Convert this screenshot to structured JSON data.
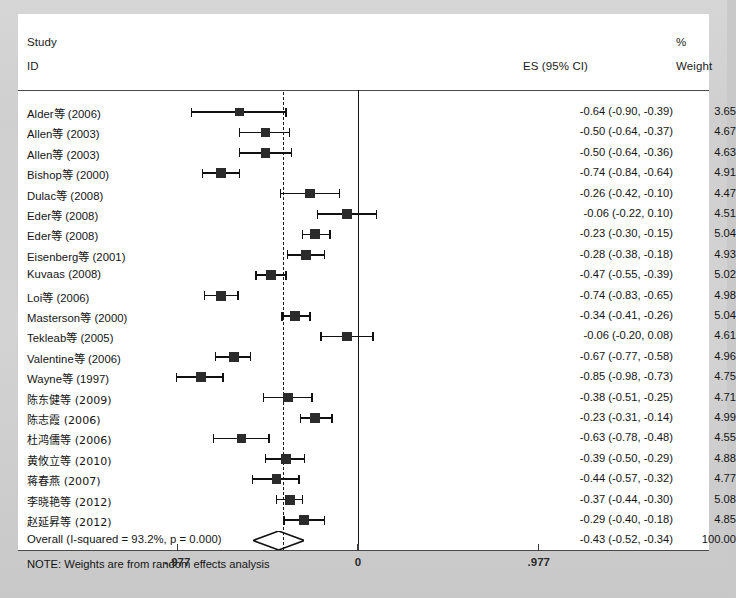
{
  "header": {
    "study_line1": "Study",
    "study_line2": "ID",
    "es_header": "ES (95% CI)",
    "weight_pct": "%",
    "weight_header": "Weight"
  },
  "note": "NOTE: Weights are from random effects analysis",
  "overall": {
    "label": "Overall  (I-squared = 93.2%, p = 0.000)",
    "es_text": "-0.43 (-0.52, -0.34)",
    "weight_text": "100.00"
  },
  "axis": {
    "left_label": "-.977",
    "center_label": "0",
    "right_label": ".977"
  },
  "chart_data": {
    "type": "forest",
    "title": "",
    "xlabel": "",
    "ylabel": "",
    "xlim": [
      -1.05,
      1.05
    ],
    "xticks": [
      -0.977,
      0,
      0.977
    ],
    "xticklabels": [
      "-.977",
      "0",
      ".977"
    ],
    "effect_measure": "ES (95% CI)",
    "null_line": 0,
    "pooled_line": -0.43,
    "heterogeneity": {
      "i_squared_pct": 93.2,
      "p_value": "0.000"
    },
    "pooled": {
      "es": -0.43,
      "lower": -0.52,
      "upper": -0.34,
      "weight": 100.0
    },
    "studies": [
      {
        "label": "Alder等 (2006)",
        "es": -0.64,
        "lower": -0.9,
        "upper": -0.39,
        "weight": 3.65,
        "es_text": "-0.64 (-0.90, -0.39)",
        "weight_text": "3.65"
      },
      {
        "label": "Allen等 (2003)",
        "es": -0.5,
        "lower": -0.64,
        "upper": -0.37,
        "weight": 4.67,
        "es_text": "-0.50 (-0.64, -0.37)",
        "weight_text": "4.67"
      },
      {
        "label": "Allen等 (2003)",
        "es": -0.5,
        "lower": -0.64,
        "upper": -0.36,
        "weight": 4.63,
        "es_text": "-0.50 (-0.64, -0.36)",
        "weight_text": "4.63"
      },
      {
        "label": "Bishop等 (2000)",
        "es": -0.74,
        "lower": -0.84,
        "upper": -0.64,
        "weight": 4.91,
        "es_text": "-0.74 (-0.84, -0.64)",
        "weight_text": "4.91"
      },
      {
        "label": "Dulac等 (2008)",
        "es": -0.26,
        "lower": -0.42,
        "upper": -0.1,
        "weight": 4.47,
        "es_text": "-0.26 (-0.42, -0.10)",
        "weight_text": "4.47"
      },
      {
        "label": "Eder等 (2008)",
        "es": -0.06,
        "lower": -0.22,
        "upper": 0.1,
        "weight": 4.51,
        "es_text": "-0.06 (-0.22, 0.10)",
        "weight_text": "4.51"
      },
      {
        "label": "Eder等 (2008)",
        "es": -0.23,
        "lower": -0.3,
        "upper": -0.15,
        "weight": 5.04,
        "es_text": "-0.23 (-0.30, -0.15)",
        "weight_text": "5.04"
      },
      {
        "label": "Eisenberg等 (2001)",
        "es": -0.28,
        "lower": -0.38,
        "upper": -0.18,
        "weight": 4.93,
        "es_text": "-0.28 (-0.38, -0.18)",
        "weight_text": "4.93"
      },
      {
        "label": "Kuvaas (2008)",
        "es": -0.47,
        "lower": -0.55,
        "upper": -0.39,
        "weight": 5.02,
        "es_text": "-0.47 (-0.55, -0.39)",
        "weight_text": "5.02"
      },
      {
        "label": "Loi等 (2006)",
        "es": -0.74,
        "lower": -0.83,
        "upper": -0.65,
        "weight": 4.98,
        "es_text": "-0.74 (-0.83, -0.65)",
        "weight_text": "4.98"
      },
      {
        "label": "Masterson等 (2000)",
        "es": -0.34,
        "lower": -0.41,
        "upper": -0.26,
        "weight": 5.04,
        "es_text": "-0.34 (-0.41, -0.26)",
        "weight_text": "5.04"
      },
      {
        "label": "Tekleab等 (2005)",
        "es": -0.06,
        "lower": -0.2,
        "upper": 0.08,
        "weight": 4.61,
        "es_text": "-0.06 (-0.20, 0.08)",
        "weight_text": "4.61"
      },
      {
        "label": "Valentine等 (2006)",
        "es": -0.67,
        "lower": -0.77,
        "upper": -0.58,
        "weight": 4.96,
        "es_text": "-0.67 (-0.77, -0.58)",
        "weight_text": "4.96"
      },
      {
        "label": "Wayne等 (1997)",
        "es": -0.85,
        "lower": -0.98,
        "upper": -0.73,
        "weight": 4.75,
        "es_text": "-0.85 (-0.98, -0.73)",
        "weight_text": "4.75"
      },
      {
        "label": "陈东健等 (2009)",
        "es": -0.38,
        "lower": -0.51,
        "upper": -0.25,
        "weight": 4.71,
        "es_text": "-0.38 (-0.51, -0.25)",
        "weight_text": "4.71",
        "cjk": true
      },
      {
        "label": "陈志霞 (2006)",
        "es": -0.23,
        "lower": -0.31,
        "upper": -0.14,
        "weight": 4.99,
        "es_text": "-0.23 (-0.31, -0.14)",
        "weight_text": "4.99",
        "cjk": true
      },
      {
        "label": "杜鸿儒等 (2006)",
        "es": -0.63,
        "lower": -0.78,
        "upper": -0.48,
        "weight": 4.55,
        "es_text": "-0.63 (-0.78, -0.48)",
        "weight_text": "4.55",
        "cjk": true
      },
      {
        "label": "黄攸立等 (2010)",
        "es": -0.39,
        "lower": -0.5,
        "upper": -0.29,
        "weight": 4.88,
        "es_text": "-0.39 (-0.50, -0.29)",
        "weight_text": "4.88",
        "cjk": true
      },
      {
        "label": "蒋春燕 (2007)",
        "es": -0.44,
        "lower": -0.57,
        "upper": -0.32,
        "weight": 4.77,
        "es_text": "-0.44 (-0.57, -0.32)",
        "weight_text": "4.77",
        "cjk": true
      },
      {
        "label": "李晓艳等 (2012)",
        "es": -0.37,
        "lower": -0.44,
        "upper": -0.3,
        "weight": 5.08,
        "es_text": "-0.37 (-0.44, -0.30)",
        "weight_text": "5.08",
        "cjk": true
      },
      {
        "label": "赵延昇等 (2012)",
        "es": -0.29,
        "lower": -0.4,
        "upper": -0.18,
        "weight": 4.85,
        "es_text": "-0.29 (-0.40, -0.18)",
        "weight_text": "4.85",
        "cjk": true
      }
    ]
  }
}
